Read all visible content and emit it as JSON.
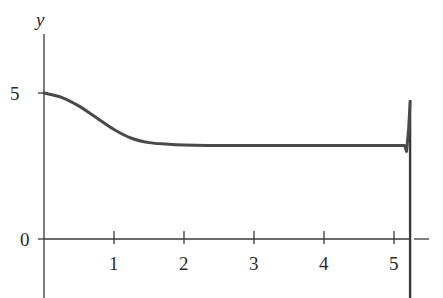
{
  "chart_data": {
    "type": "line",
    "title": "",
    "xlabel": "",
    "ylabel": "y",
    "x_ticks": [
      "1",
      "2",
      "3",
      "4",
      "5"
    ],
    "y_ticks": [
      "0",
      "5"
    ],
    "xlim": [
      0,
      5.4
    ],
    "ylim": [
      -2,
      6.5
    ],
    "grid": false,
    "legend": null,
    "vertical_line": {
      "x": 5.23,
      "style": "solid"
    },
    "series": [
      {
        "name": "y(t)",
        "x": [
          0,
          0.25,
          0.5,
          0.75,
          1.0,
          1.25,
          1.5,
          1.75,
          2.0,
          2.5,
          3.0,
          3.5,
          4.0,
          4.5,
          5.0,
          5.15,
          5.18,
          5.21,
          5.23
        ],
        "y": [
          5.0,
          4.85,
          4.55,
          4.15,
          3.75,
          3.45,
          3.3,
          3.25,
          3.22,
          3.2,
          3.2,
          3.2,
          3.2,
          3.2,
          3.2,
          3.2,
          3.0,
          3.8,
          4.7
        ]
      }
    ]
  }
}
